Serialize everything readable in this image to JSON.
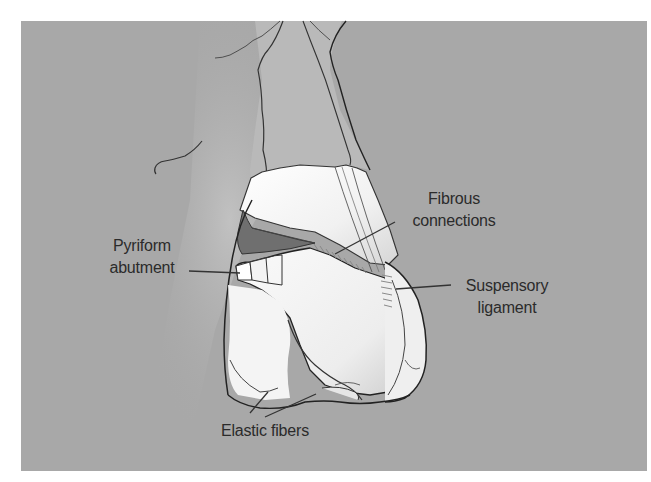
{
  "figure": {
    "type": "anatomical-illustration",
    "colors": {
      "background": "#a8a8a8",
      "frame": "#ffffff",
      "bone": "#bdbdbd",
      "cartilage": "#f2f2f2",
      "outline": "#2a2a2a",
      "label_text": "#2b2b2b"
    }
  },
  "labels": {
    "fibrous_connections": {
      "line1": "Fibrous",
      "line2": "connections"
    },
    "pyriform_abutment": {
      "line1": "Pyriform",
      "line2": "abutment"
    },
    "suspensory_ligament": {
      "line1": "Suspensory",
      "line2": "ligament"
    },
    "elastic_fibers": {
      "line1": "Elastic fibers"
    }
  }
}
